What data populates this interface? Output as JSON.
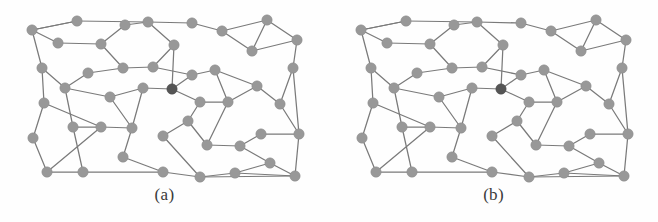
{
  "figure": {
    "type": "two-panel-graph-diagram",
    "background_color": "#fefefe",
    "node_color": "#989898",
    "highlight_node_color": "#555555",
    "edge_color": "#7a7a7a",
    "node_radius": 5.2,
    "panel_width": 329,
    "panel_height": 222,
    "graph_area_height": 190
  },
  "panels": [
    {
      "id": "a",
      "caption": "(a)",
      "highlight_node_index": 24,
      "nodes": [
        {
          "id": 0,
          "x": 32,
          "y": 30
        },
        {
          "id": 1,
          "x": 77,
          "y": 21
        },
        {
          "id": 2,
          "x": 125,
          "y": 25
        },
        {
          "id": 3,
          "x": 148,
          "y": 22
        },
        {
          "id": 4,
          "x": 192,
          "y": 23
        },
        {
          "id": 5,
          "x": 222,
          "y": 31
        },
        {
          "id": 6,
          "x": 267,
          "y": 20
        },
        {
          "id": 7,
          "x": 58,
          "y": 43
        },
        {
          "id": 8,
          "x": 101,
          "y": 44
        },
        {
          "id": 9,
          "x": 174,
          "y": 45
        },
        {
          "id": 10,
          "x": 252,
          "y": 51
        },
        {
          "id": 11,
          "x": 297,
          "y": 40
        },
        {
          "id": 12,
          "x": 42,
          "y": 68
        },
        {
          "id": 13,
          "x": 88,
          "y": 73
        },
        {
          "id": 14,
          "x": 123,
          "y": 68
        },
        {
          "id": 15,
          "x": 153,
          "y": 67
        },
        {
          "id": 16,
          "x": 192,
          "y": 75
        },
        {
          "id": 17,
          "x": 215,
          "y": 70
        },
        {
          "id": 18,
          "x": 293,
          "y": 68
        },
        {
          "id": 19,
          "x": 65,
          "y": 88
        },
        {
          "id": 20,
          "x": 110,
          "y": 97
        },
        {
          "id": 21,
          "x": 143,
          "y": 88
        },
        {
          "id": 22,
          "x": 257,
          "y": 86
        },
        {
          "id": 23,
          "x": 44,
          "y": 103
        },
        {
          "id": 24,
          "x": 172,
          "y": 89
        },
        {
          "id": 25,
          "x": 200,
          "y": 102
        },
        {
          "id": 26,
          "x": 228,
          "y": 102
        },
        {
          "id": 27,
          "x": 280,
          "y": 104
        },
        {
          "id": 28,
          "x": 33,
          "y": 138
        },
        {
          "id": 29,
          "x": 73,
          "y": 127
        },
        {
          "id": 30,
          "x": 101,
          "y": 127
        },
        {
          "id": 31,
          "x": 132,
          "y": 128
        },
        {
          "id": 32,
          "x": 188,
          "y": 121
        },
        {
          "id": 33,
          "x": 261,
          "y": 134
        },
        {
          "id": 34,
          "x": 299,
          "y": 134
        },
        {
          "id": 35,
          "x": 123,
          "y": 157
        },
        {
          "id": 36,
          "x": 163,
          "y": 136
        },
        {
          "id": 37,
          "x": 207,
          "y": 145
        },
        {
          "id": 38,
          "x": 240,
          "y": 146
        },
        {
          "id": 39,
          "x": 47,
          "y": 172
        },
        {
          "id": 40,
          "x": 83,
          "y": 172
        },
        {
          "id": 41,
          "x": 163,
          "y": 172
        },
        {
          "id": 42,
          "x": 200,
          "y": 177
        },
        {
          "id": 43,
          "x": 270,
          "y": 163
        },
        {
          "id": 44,
          "x": 235,
          "y": 173
        },
        {
          "id": 45,
          "x": 295,
          "y": 176
        }
      ],
      "edges": [
        [
          0,
          1
        ],
        [
          1,
          3
        ],
        [
          3,
          4
        ],
        [
          4,
          5
        ],
        [
          5,
          6
        ],
        [
          5,
          10
        ],
        [
          6,
          10
        ],
        [
          6,
          11
        ],
        [
          10,
          11
        ],
        [
          0,
          7
        ],
        [
          7,
          8
        ],
        [
          0,
          12
        ],
        [
          12,
          19
        ],
        [
          12,
          23
        ],
        [
          2,
          8
        ],
        [
          8,
          14
        ],
        [
          3,
          9
        ],
        [
          9,
          15
        ],
        [
          9,
          24
        ],
        [
          13,
          19
        ],
        [
          13,
          14
        ],
        [
          14,
          15
        ],
        [
          15,
          16
        ],
        [
          16,
          17
        ],
        [
          17,
          22
        ],
        [
          16,
          24
        ],
        [
          24,
          25
        ],
        [
          25,
          26
        ],
        [
          26,
          22
        ],
        [
          22,
          27
        ],
        [
          11,
          18
        ],
        [
          18,
          27
        ],
        [
          27,
          34
        ],
        [
          18,
          34
        ],
        [
          19,
          20
        ],
        [
          20,
          21
        ],
        [
          21,
          24
        ],
        [
          19,
          29
        ],
        [
          20,
          31
        ],
        [
          23,
          28
        ],
        [
          23,
          30
        ],
        [
          29,
          30
        ],
        [
          30,
          31
        ],
        [
          28,
          39
        ],
        [
          29,
          40
        ],
        [
          31,
          35
        ],
        [
          35,
          41
        ],
        [
          41,
          42
        ],
        [
          39,
          40
        ],
        [
          39,
          30
        ],
        [
          40,
          41
        ],
        [
          25,
          32
        ],
        [
          32,
          36
        ],
        [
          36,
          42
        ],
        [
          32,
          37
        ],
        [
          37,
          38
        ],
        [
          26,
          37
        ],
        [
          33,
          34
        ],
        [
          33,
          38
        ],
        [
          38,
          43
        ],
        [
          43,
          44
        ],
        [
          43,
          45
        ],
        [
          44,
          45
        ],
        [
          44,
          42
        ],
        [
          42,
          45
        ],
        [
          21,
          31
        ],
        [
          34,
          45
        ],
        [
          2,
          3
        ],
        [
          1,
          0
        ],
        [
          17,
          26
        ]
      ]
    },
    {
      "id": "b",
      "caption": "(b)",
      "highlight_node_index": 24,
      "nodes": [
        {
          "id": 0,
          "x": 32,
          "y": 30
        },
        {
          "id": 1,
          "x": 77,
          "y": 21
        },
        {
          "id": 2,
          "x": 125,
          "y": 25
        },
        {
          "id": 3,
          "x": 148,
          "y": 22
        },
        {
          "id": 4,
          "x": 192,
          "y": 23
        },
        {
          "id": 5,
          "x": 222,
          "y": 31
        },
        {
          "id": 6,
          "x": 267,
          "y": 20
        },
        {
          "id": 7,
          "x": 58,
          "y": 43
        },
        {
          "id": 8,
          "x": 101,
          "y": 44
        },
        {
          "id": 9,
          "x": 174,
          "y": 45
        },
        {
          "id": 10,
          "x": 252,
          "y": 51
        },
        {
          "id": 11,
          "x": 297,
          "y": 40
        },
        {
          "id": 12,
          "x": 42,
          "y": 68
        },
        {
          "id": 13,
          "x": 88,
          "y": 73
        },
        {
          "id": 14,
          "x": 123,
          "y": 68
        },
        {
          "id": 15,
          "x": 153,
          "y": 67
        },
        {
          "id": 16,
          "x": 192,
          "y": 75
        },
        {
          "id": 17,
          "x": 215,
          "y": 70
        },
        {
          "id": 18,
          "x": 293,
          "y": 68
        },
        {
          "id": 19,
          "x": 65,
          "y": 88
        },
        {
          "id": 20,
          "x": 110,
          "y": 97
        },
        {
          "id": 21,
          "x": 143,
          "y": 88
        },
        {
          "id": 22,
          "x": 257,
          "y": 86
        },
        {
          "id": 23,
          "x": 44,
          "y": 103
        },
        {
          "id": 24,
          "x": 172,
          "y": 89
        },
        {
          "id": 25,
          "x": 200,
          "y": 102
        },
        {
          "id": 26,
          "x": 228,
          "y": 102
        },
        {
          "id": 27,
          "x": 280,
          "y": 104
        },
        {
          "id": 28,
          "x": 33,
          "y": 138
        },
        {
          "id": 29,
          "x": 73,
          "y": 127
        },
        {
          "id": 30,
          "x": 101,
          "y": 127
        },
        {
          "id": 31,
          "x": 132,
          "y": 128
        },
        {
          "id": 32,
          "x": 188,
          "y": 121
        },
        {
          "id": 33,
          "x": 261,
          "y": 134
        },
        {
          "id": 34,
          "x": 299,
          "y": 134
        },
        {
          "id": 35,
          "x": 123,
          "y": 157
        },
        {
          "id": 36,
          "x": 163,
          "y": 136
        },
        {
          "id": 37,
          "x": 207,
          "y": 145
        },
        {
          "id": 38,
          "x": 240,
          "y": 146
        },
        {
          "id": 39,
          "x": 47,
          "y": 172
        },
        {
          "id": 40,
          "x": 83,
          "y": 172
        },
        {
          "id": 41,
          "x": 163,
          "y": 172
        },
        {
          "id": 42,
          "x": 200,
          "y": 177
        },
        {
          "id": 43,
          "x": 270,
          "y": 163
        },
        {
          "id": 44,
          "x": 235,
          "y": 173
        },
        {
          "id": 45,
          "x": 295,
          "y": 176
        }
      ],
      "edges": [
        [
          0,
          1
        ],
        [
          1,
          3
        ],
        [
          3,
          4
        ],
        [
          4,
          5
        ],
        [
          5,
          6
        ],
        [
          5,
          10
        ],
        [
          6,
          10
        ],
        [
          6,
          11
        ],
        [
          10,
          11
        ],
        [
          0,
          7
        ],
        [
          7,
          8
        ],
        [
          0,
          12
        ],
        [
          12,
          19
        ],
        [
          12,
          23
        ],
        [
          2,
          8
        ],
        [
          8,
          14
        ],
        [
          3,
          9
        ],
        [
          9,
          15
        ],
        [
          9,
          24
        ],
        [
          13,
          19
        ],
        [
          13,
          14
        ],
        [
          14,
          15
        ],
        [
          15,
          16
        ],
        [
          16,
          17
        ],
        [
          17,
          22
        ],
        [
          16,
          24
        ],
        [
          24,
          25
        ],
        [
          25,
          26
        ],
        [
          26,
          22
        ],
        [
          22,
          27
        ],
        [
          11,
          18
        ],
        [
          18,
          27
        ],
        [
          27,
          34
        ],
        [
          18,
          34
        ],
        [
          19,
          20
        ],
        [
          20,
          21
        ],
        [
          21,
          24
        ],
        [
          19,
          29
        ],
        [
          20,
          31
        ],
        [
          23,
          28
        ],
        [
          23,
          30
        ],
        [
          29,
          30
        ],
        [
          30,
          31
        ],
        [
          28,
          39
        ],
        [
          29,
          40
        ],
        [
          31,
          35
        ],
        [
          35,
          41
        ],
        [
          41,
          42
        ],
        [
          39,
          40
        ],
        [
          39,
          30
        ],
        [
          40,
          41
        ],
        [
          25,
          32
        ],
        [
          32,
          36
        ],
        [
          36,
          42
        ],
        [
          32,
          37
        ],
        [
          37,
          38
        ],
        [
          26,
          37
        ],
        [
          33,
          34
        ],
        [
          33,
          38
        ],
        [
          38,
          43
        ],
        [
          43,
          44
        ],
        [
          43,
          45
        ],
        [
          44,
          45
        ],
        [
          44,
          42
        ],
        [
          42,
          45
        ],
        [
          21,
          31
        ],
        [
          34,
          45
        ],
        [
          2,
          3
        ],
        [
          1,
          0
        ],
        [
          17,
          26
        ]
      ]
    }
  ]
}
